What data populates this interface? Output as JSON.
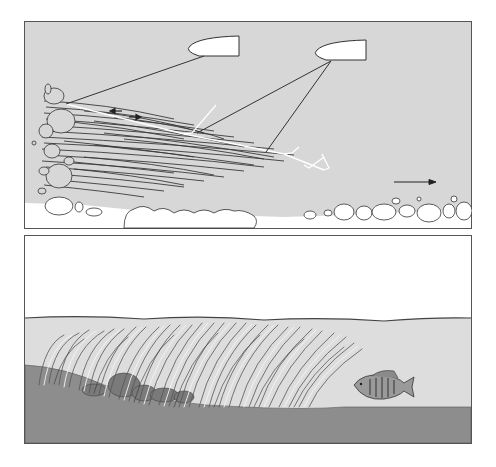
{
  "figure": {
    "panels": [
      {
        "id": "top",
        "subject": "Top-down view of two boats casting lines toward a weedline along a rocky shoreline",
        "elements": [
          "boat",
          "boat",
          "fishing-line",
          "fishing-line",
          "fishing-line",
          "weedbed",
          "rocks",
          "shoreline",
          "current-arrow",
          "small-arrows"
        ]
      },
      {
        "id": "bottom",
        "subject": "Side view of submerged weedbed over rocks with a fish holding at the weed edge",
        "elements": [
          "sky",
          "water-surface",
          "water",
          "weeds",
          "rocks",
          "lake-bottom",
          "fish"
        ]
      }
    ]
  },
  "colors": {
    "frame": "#555555",
    "top_water": "#d7d7d7",
    "shore": "#ffffff",
    "line_dark": "#333333",
    "line_light": "#ffffff",
    "bottom_sky": "#ffffff",
    "bottom_water": "#dddddd",
    "bottom_bed": "#8d8d8d",
    "weed_dark": "#444444",
    "weed_light": "#f2f2f2"
  }
}
